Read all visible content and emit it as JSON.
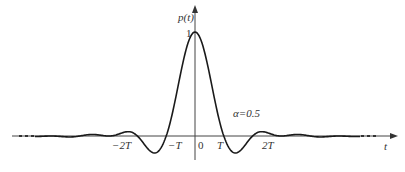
{
  "chart_data": {
    "type": "line",
    "title": "",
    "xlabel": "t",
    "ylabel": "p(t)",
    "annotation": "α=0.5",
    "y_tick_labels": [
      "1"
    ],
    "x_tick_labels": [
      "-2T",
      "-T",
      "0",
      "T",
      "2T"
    ],
    "xlim_in_T": [
      -7.5,
      7.5
    ],
    "ylim": [
      -0.12,
      1.1
    ],
    "grid": false,
    "legend": null,
    "series": [
      {
        "name": "raised-cosine pulse p(t), α=0.5",
        "x_in_T": [
          -7,
          -6,
          -5,
          -4,
          -3,
          -2.5,
          -2,
          -1.5,
          -1,
          -0.5,
          0,
          0.5,
          1,
          1.5,
          2,
          2.5,
          3,
          4,
          5,
          6,
          7
        ],
        "values": [
          0.0,
          0.01,
          -0.01,
          0.02,
          -0.03,
          0.0,
          0.05,
          -0.1,
          0.0,
          0.6,
          1.0,
          0.6,
          0.0,
          -0.1,
          0.05,
          0.0,
          -0.03,
          0.02,
          -0.01,
          0.01,
          0.0
        ]
      }
    ]
  },
  "labels": {
    "y_axis": "p(t)",
    "y_one": "1",
    "x_axis": "t",
    "alpha": "α=0.5",
    "neg2T": "−2T",
    "negT": "−T",
    "zero": "0",
    "T": "T",
    "twoT": "2T"
  },
  "colors": {
    "curve": "#1a1a1a",
    "axis": "#444444",
    "text": "#333333"
  }
}
